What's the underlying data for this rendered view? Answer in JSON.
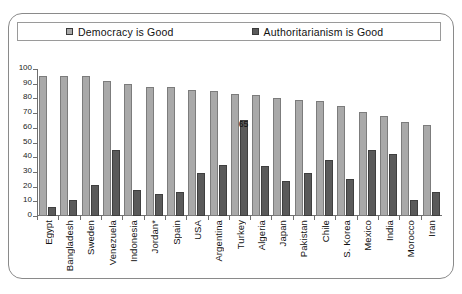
{
  "legend": {
    "entries": [
      {
        "label": "Democracy  is Good",
        "color": "#a9a9a9",
        "key": "democracy"
      },
      {
        "label": "Authoritarianism is Good",
        "color": "#5a5a5a",
        "key": "authoritarianism"
      }
    ]
  },
  "axis": {
    "y_ticks": [
      "0",
      "10",
      "20",
      "30",
      "40",
      "50",
      "60",
      "70",
      "80",
      "90",
      "100"
    ]
  },
  "annotations": {
    "turkey_authoritarianism_value": "65"
  },
  "chart_data": {
    "type": "bar",
    "title": "",
    "subtitle": "",
    "xlabel": "",
    "ylabel": "",
    "ylim": [
      0,
      100
    ],
    "ytick_step": 10,
    "grid": false,
    "legend_position": "top",
    "categories": [
      "Egypt",
      "Bangladesh",
      "Sweden",
      "Venezuela",
      "Indonesia",
      "Jordan*",
      "Spain",
      "USA",
      "Argentina",
      "Turkey",
      "Algeria",
      "Japan",
      "Pakistan",
      "Chile",
      "S. Korea",
      "Mexico",
      "India",
      "Morocco",
      "Iran"
    ],
    "series": [
      {
        "name": "Democracy  is Good",
        "color": "#a9a9a9",
        "values": [
          95,
          95,
          95,
          92,
          90,
          88,
          88,
          86,
          85,
          83,
          82,
          80,
          79,
          78,
          75,
          71,
          68,
          64,
          62
        ]
      },
      {
        "name": "Authoritarianism is Good",
        "color": "#5a5a5a",
        "values": [
          6,
          11,
          21,
          45,
          18,
          15,
          16,
          29,
          35,
          65,
          34,
          24,
          29,
          38,
          25,
          45,
          42,
          11,
          16
        ]
      }
    ],
    "data_labels": [
      {
        "category": "Turkey",
        "series": "Authoritarianism is Good",
        "text": "65"
      }
    ]
  }
}
